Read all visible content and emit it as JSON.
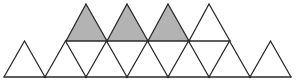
{
  "figure": {
    "colors": {
      "stroke": "#2a2a2a",
      "shaded_fill": "#b3b3b3",
      "background": "#ffffff"
    },
    "row_y": {
      "top": 4,
      "middle": 41,
      "bottom": 77
    },
    "bottom_row_x": [
      4,
      45,
      86,
      127,
      168,
      209,
      250,
      291
    ],
    "middle_row_x": [
      66,
      107,
      148,
      189,
      230
    ],
    "top_apex_x": [
      86,
      127,
      168,
      209
    ],
    "shaded_top_triangles": [
      0,
      1,
      2
    ],
    "counts": {
      "bottom_row_upward_triangles": 7,
      "top_row_triangles": 4,
      "shaded": 3
    }
  }
}
